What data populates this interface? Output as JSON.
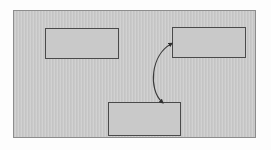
{
  "diagram": {
    "title": "",
    "frame": {
      "background_color": "#c9c9c9",
      "border_color": "#8d8d8d"
    },
    "nodes": [
      {
        "id": "box-1",
        "label": "",
        "position": "top-left",
        "shape": "rectangle",
        "fill_color": "#c9c9c9",
        "border_color": "#4a4a4a"
      },
      {
        "id": "box-2",
        "label": "",
        "position": "top-right",
        "shape": "rectangle",
        "fill_color": "#c9c9c9",
        "border_color": "#4a4a4a"
      },
      {
        "id": "box-3",
        "label": "",
        "position": "bottom-center",
        "shape": "rectangle",
        "fill_color": "#c9c9c9",
        "border_color": "#4a4a4a"
      }
    ],
    "connectors": [
      {
        "id": "connector-1",
        "label": "",
        "from": "box-2",
        "to": "box-3",
        "style": "curved",
        "bulge_direction": "left",
        "arrowheads": "both",
        "line_color": "#3a3a3a"
      }
    ]
  }
}
